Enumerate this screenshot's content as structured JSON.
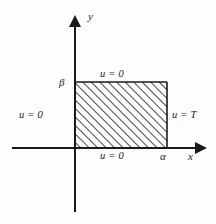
{
  "figure": {
    "type": "diagram",
    "background_color": "#fdfdfd",
    "line_color": "#1a1a1a",
    "axes": {
      "x_label": "x",
      "y_label": "y",
      "origin": {
        "x": 75,
        "y": 148
      },
      "x_axis": {
        "start_x": 12,
        "end_x": 203,
        "y": 148,
        "arrow": "right"
      },
      "y_axis": {
        "x": 75,
        "start_y": 212,
        "end_y": 18,
        "arrow": "up"
      }
    },
    "region": {
      "name": "hatched-rectangle",
      "left": 75,
      "top": 82,
      "right": 167,
      "bottom": 148,
      "fill": "diagonal-hatch",
      "hatch_angle_deg": 45,
      "hatch_color": "#1a1a1a",
      "border_color": "#1a1a1a"
    },
    "tick_labels": {
      "x_extent": "α",
      "y_extent": "β"
    },
    "boundary_conditions": {
      "top": "u = 0",
      "left": "u = 0",
      "bottom": "u = 0",
      "right": "u = T"
    }
  }
}
